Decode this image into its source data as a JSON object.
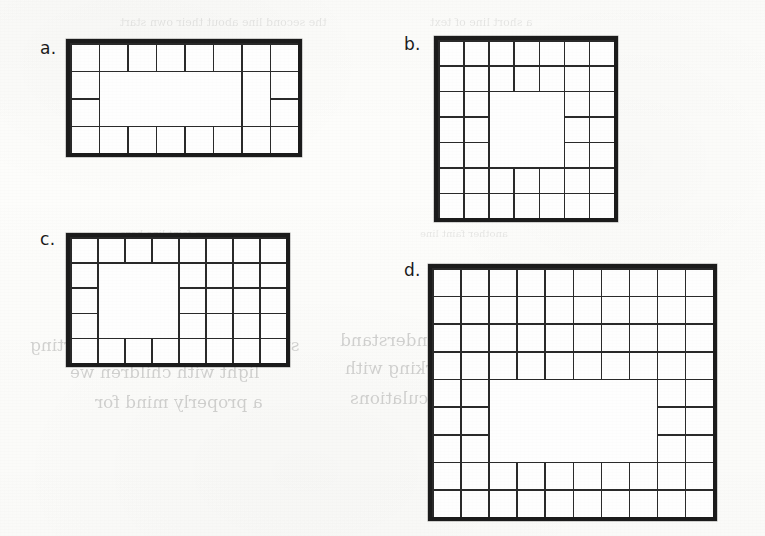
{
  "page": {
    "background_color": "#fdfdfb",
    "ink_color": "#1c1c1c",
    "width": 765,
    "height": 536,
    "medium": "scanned textbook page"
  },
  "bleed_through_text": [
    {
      "id": "bt1",
      "text": "the second line about their own start",
      "x": 120,
      "y": 16,
      "size": 11,
      "faint": true
    },
    {
      "id": "bt2",
      "text": "a short line of text",
      "x": 430,
      "y": 16,
      "size": 11,
      "faint": true
    },
    {
      "id": "bt3",
      "text": "a faint line here",
      "x": 120,
      "y": 228,
      "size": 10,
      "faint": true
    },
    {
      "id": "bt4",
      "text": "another faint line",
      "x": 420,
      "y": 228,
      "size": 10,
      "faint": true
    },
    {
      "id": "bt5",
      "text": "students see their own starting",
      "x": 30,
      "y": 335,
      "size": 17,
      "faint": false
    },
    {
      "id": "bt6",
      "text": "they are  independently  understand",
      "x": 340,
      "y": 330,
      "size": 17,
      "faint": false
    },
    {
      "id": "bt7",
      "text": "light with children we",
      "x": 70,
      "y": 362,
      "size": 17,
      "faint": false
    },
    {
      "id": "bt8",
      "text": "exercise is get working with",
      "x": 345,
      "y": 358,
      "size": 17,
      "faint": false
    },
    {
      "id": "bt9",
      "text": "a properly mind for",
      "x": 95,
      "y": 392,
      "size": 17,
      "faint": false
    },
    {
      "id": "bt10",
      "text": "the following calculations",
      "x": 350,
      "y": 388,
      "size": 17,
      "faint": false
    }
  ],
  "figures": [
    {
      "id": "a",
      "label": "a.",
      "label_x": 40,
      "label_y": 40,
      "x": 66,
      "y": 39,
      "width": 236,
      "height": 118,
      "cols": 8,
      "rows": 4,
      "ring_thickness": 1,
      "pattern": "rectangular-ring",
      "border_cells": 20,
      "interior_empty": true,
      "extra_lines": {
        "left_column_splits": [
          {
            "col": 1,
            "from_row": 1,
            "to_row": 3
          }
        ],
        "right_column_splits": [
          {
            "col": 6,
            "from_row": 2,
            "to_row": 4
          }
        ]
      }
    },
    {
      "id": "b",
      "label": "b.",
      "label_x": 404,
      "label_y": 36,
      "x": 434,
      "y": 36,
      "width": 184,
      "height": 186,
      "cols": 7,
      "rows": 7,
      "ring_thickness": 2,
      "pattern": "rectangular-ring",
      "border_cells": 40,
      "interior_empty": true,
      "notes": "two-cell-thick ring; inner 3x3 region is blank"
    },
    {
      "id": "c",
      "label": "c.",
      "label_x": 40,
      "label_y": 231,
      "x": 66,
      "y": 233,
      "width": 224,
      "height": 134,
      "cols": 8,
      "rows": 5,
      "ring_thickness": 1,
      "pattern": "rectangular-ring-with-right-block",
      "border_cells": 26,
      "interior_empty": false,
      "notes": "right-hand portion is a solid filled 4x3 block of cells"
    },
    {
      "id": "d",
      "label": "d.",
      "label_x": 404,
      "label_y": 262,
      "x": 428,
      "y": 264,
      "width": 289,
      "height": 257,
      "cols": 10,
      "rows": 9,
      "ring_thickness": 2,
      "pattern": "rectangular-ring-irregular",
      "border_cells": 62,
      "interior_empty": true,
      "notes": "two-cell-thick ring with an extra third-row band on the upper-left"
    }
  ]
}
